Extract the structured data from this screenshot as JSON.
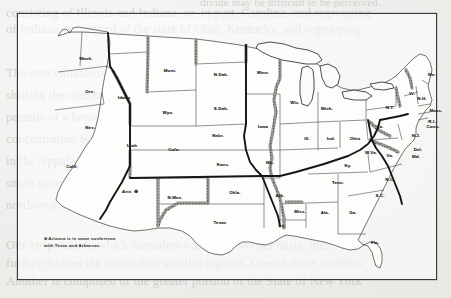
{
  "figure": {
    "type": "map",
    "region": "Contiguous United States",
    "caption_note": "⊕ Arizona is in same conference\nwith Texas and Arkansas.",
    "note_symbol": "⊕",
    "legend_items": [
      {
        "name": "conference-boundary",
        "style": "heavy solid line",
        "color": "#1c1b1a"
      },
      {
        "name": "state-boundary",
        "style": "thin solid line",
        "color": "#4a4947"
      },
      {
        "name": "river-shading",
        "style": "gray stippled band",
        "color": "#8d8b88"
      }
    ]
  },
  "state_labels": [
    {
      "abbr": "Wash.",
      "x": 68,
      "y": 44
    },
    {
      "abbr": "Ore.",
      "x": 72,
      "y": 77
    },
    {
      "abbr": "Idaho",
      "x": 106,
      "y": 83
    },
    {
      "abbr": "Nev.",
      "x": 72,
      "y": 113
    },
    {
      "abbr": "Calif.",
      "x": 54,
      "y": 152
    },
    {
      "abbr": "Mont.",
      "x": 152,
      "y": 56
    },
    {
      "abbr": "Wyo.",
      "x": 150,
      "y": 98
    },
    {
      "abbr": "Utah",
      "x": 114,
      "y": 131
    },
    {
      "abbr": "Colo.",
      "x": 156,
      "y": 135
    },
    {
      "abbr": "Ariz.",
      "x": 112,
      "y": 177
    },
    {
      "abbr": "N.Mex.",
      "x": 157,
      "y": 183
    },
    {
      "abbr": "N.Dak.",
      "x": 203,
      "y": 60
    },
    {
      "abbr": "S.Dak.",
      "x": 203,
      "y": 94
    },
    {
      "abbr": "Nebr.",
      "x": 200,
      "y": 121
    },
    {
      "abbr": "Kans.",
      "x": 205,
      "y": 150
    },
    {
      "abbr": "Okla.",
      "x": 217,
      "y": 178
    },
    {
      "abbr": "Texas",
      "x": 202,
      "y": 208
    },
    {
      "abbr": "Minn.",
      "x": 245,
      "y": 58
    },
    {
      "abbr": "Iowa",
      "x": 245,
      "y": 112
    },
    {
      "abbr": "Mo.",
      "x": 252,
      "y": 148
    },
    {
      "abbr": "Ark.",
      "x": 262,
      "y": 181
    },
    {
      "abbr": "La.",
      "x": 264,
      "y": 211
    },
    {
      "abbr": "Wis.",
      "x": 277,
      "y": 88
    },
    {
      "abbr": "Ill.",
      "x": 289,
      "y": 124
    },
    {
      "abbr": "Miss.",
      "x": 282,
      "y": 197
    },
    {
      "abbr": "Mich.",
      "x": 309,
      "y": 94
    },
    {
      "abbr": "Ind.",
      "x": 313,
      "y": 124
    },
    {
      "abbr": "Ohio",
      "x": 337,
      "y": 124
    },
    {
      "abbr": "Ky.",
      "x": 330,
      "y": 151
    },
    {
      "abbr": "Tenn.",
      "x": 320,
      "y": 168
    },
    {
      "abbr": "Ala.",
      "x": 307,
      "y": 198
    },
    {
      "abbr": "Ga.",
      "x": 335,
      "y": 198
    },
    {
      "abbr": "Fla.",
      "x": 357,
      "y": 228
    },
    {
      "abbr": "W.Va.",
      "x": 353,
      "y": 138
    },
    {
      "abbr": "Va.",
      "x": 372,
      "y": 141
    },
    {
      "abbr": "N.C.",
      "x": 372,
      "y": 165
    },
    {
      "abbr": "S.C.",
      "x": 362,
      "y": 181
    },
    {
      "abbr": "Pa.",
      "x": 362,
      "y": 112
    },
    {
      "abbr": "N.Y.",
      "x": 372,
      "y": 93
    },
    {
      "abbr": "N.J.",
      "x": 398,
      "y": 121
    },
    {
      "abbr": "Del.",
      "x": 400,
      "y": 135
    },
    {
      "abbr": "Md.",
      "x": 398,
      "y": 142
    },
    {
      "abbr": "Vt.",
      "x": 394,
      "y": 79
    },
    {
      "abbr": "N.H.",
      "x": 404,
      "y": 84
    },
    {
      "abbr": "Me.",
      "x": 414,
      "y": 60
    },
    {
      "abbr": "Mass.",
      "x": 418,
      "y": 96
    },
    {
      "abbr": "R.I.",
      "x": 414,
      "y": 107
    },
    {
      "abbr": "Conn.",
      "x": 415,
      "y": 112
    }
  ],
  "page_showthrough": {
    "lines": [
      "consisting of Illinois and Indiana, or, in part, Carolina, and regrouping",
      "of Indiana comprised of the state of Ohio, Kentucky, and regrouping",
      "with Arizona and Texas and Arkansas in part.",
      "The concentration of the regions that the geographic areas",
      "shifting the membership toward the central, and of the markets",
      "permits of a broader regrouping that reassembles the groupings",
      "concentration is that beyond the more central regions as the",
      "in the Appalachian portion of the more southerly states of",
      "small states of the eastern seaboard are the middle tier",
      "northwest. A regrouping of the West or along all the",
      "divide may be difficult to be perceived.",
      "One corporation, which furnishes a uniform overall basis, then",
      "further divides the nation into smaller regions. One of these includes",
      "the entire of New England Group, plus a part of New York State.",
      "Another is composed of the greater portion of the State of New York"
    ]
  }
}
